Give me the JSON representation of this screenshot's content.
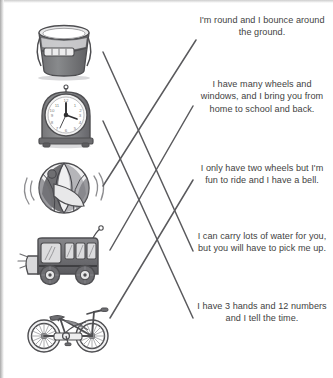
{
  "worksheet": {
    "type": "matching-activity",
    "instruction_visible": false,
    "ink_color": "#58585b",
    "text_color": "#3f3f42",
    "line_color": "#5a5a5d",
    "background": "#ffffff"
  },
  "pictures": [
    {
      "id": "bucket",
      "icon": "bucket-icon",
      "label": "bucket",
      "top": 0
    },
    {
      "id": "clock",
      "icon": "alarm-clock-icon",
      "label": "alarm clock",
      "top": 70
    },
    {
      "id": "beachball",
      "icon": "beach-ball-icon",
      "label": "beach ball",
      "top": 140
    },
    {
      "id": "bus",
      "icon": "bus-icon",
      "label": "bus",
      "top": 208
    },
    {
      "id": "bicycle",
      "icon": "bicycle-icon",
      "label": "bicycle",
      "top": 276
    }
  ],
  "riddles": [
    {
      "id": "riddle-1",
      "text": "I'm round and I bounce around the ground.",
      "top": 14
    },
    {
      "id": "riddle-2",
      "text": "I have many wheels and windows, and I bring you from home to school and back.",
      "top": 78
    },
    {
      "id": "riddle-3",
      "text": "I only have two wheels but I'm fun to ride and I have a bell.",
      "top": 162
    },
    {
      "id": "riddle-4",
      "text": "I can carry lots of water for you, but you will have to pick me up.",
      "top": 230
    },
    {
      "id": "riddle-5",
      "text": "I have 3 hands and 12 numbers and I tell the time.",
      "top": 300
    }
  ],
  "connections": [
    {
      "id": "line-bucket-to-water",
      "from": "bucket",
      "to": "riddle-4",
      "x1": 103,
      "y1": 52,
      "x2": 193,
      "y2": 251
    },
    {
      "id": "line-clock-to-time",
      "from": "clock",
      "to": "riddle-5",
      "x1": 103,
      "y1": 121,
      "x2": 193,
      "y2": 318
    },
    {
      "id": "line-beachball-to-round",
      "from": "beachball",
      "to": "riddle-1",
      "x1": 103,
      "y1": 186,
      "x2": 196,
      "y2": 40
    },
    {
      "id": "line-bus-to-wheels",
      "from": "bus",
      "to": "riddle-2",
      "x1": 110,
      "y1": 250,
      "x2": 193,
      "y2": 106
    },
    {
      "id": "line-bicycle-to-twowheels",
      "from": "bicycle",
      "to": "riddle-3",
      "x1": 110,
      "y1": 318,
      "x2": 193,
      "y2": 180
    }
  ]
}
